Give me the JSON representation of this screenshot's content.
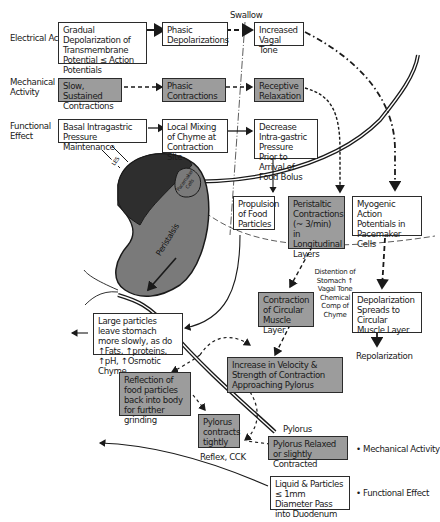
{
  "row_labels": {
    "electrical": "Electrical Activity",
    "mechanical": "Mechanical Activity",
    "functional": "Functional Effect"
  },
  "swallow_label": "Swallow",
  "boxes": {
    "gradual_depol": "Gradual Depolarization of Transmembrane Potential ≤ Action Potentials",
    "phasic_depol": "Phasic Depolarizations",
    "increased_vagal": "Increased Vagal Tone",
    "slow_sustained": "Slow, Sustained Contractions",
    "phasic_contractions": "Phasic Contractions",
    "receptive_relax": "Receptive Relaxation",
    "basal_pressure": "Basal Intragastric Pressure Maintenance",
    "local_mixing": "Local Mixing of Chyme at Contraction Site",
    "decrease_pressure": "Decrease Intra-gastric Pressure Prior to Arrival of Food Bolus",
    "propulsion": "Propulsion of Food Particles",
    "peristaltic": "Peristaltic Contractions (~ 3/min) in Longitudinal Layers",
    "myogenic": "Myogenic Action Potentials in Pacemaker Cells",
    "contraction_circular": "Contraction of Circular Muscle Layer",
    "depol_spreads": "Depolarization Spreads to Circular Muscle Layer",
    "large_particles": "Large particles leave stomach more slowly, as do ↑Fats, ↑proteins, ↑pH, ↑Osmotic Chyme",
    "increase_velocity": "Increase in Velocity & Strength of Contraction Approaching Pylorus",
    "reflection": "Reflection of food particles back into body for further grinding",
    "pylorus_contracts": "Pylorus contracts tightly",
    "pylorus_relaxed": "Pylorus Relaxed or slightly Contracted",
    "liquid_particles": "Liquid & Particles ≤ 1mm Diameter Pass into Duodenum"
  },
  "annotations": {
    "distention": "Distention of Stomach ↑ Vagal Tone Chemical Comp of Chyme",
    "repolarization": "Repolarization",
    "pylorus": "Pylorus",
    "reflex_cck": "Reflex, CCK"
  },
  "stomach": {
    "les": "LES",
    "pacemaker": "Pacemaker Cells",
    "peristalsis": "Peristalsis"
  },
  "legend": {
    "mechanical": "Mechanical Activity",
    "functional": "Functional Effect"
  },
  "colors": {
    "mechanical_fill": "#9c9c9c",
    "fundus_fill": "#2e2e2e",
    "body_fill": "#7a7a7a",
    "border": "#2b2b2b"
  }
}
